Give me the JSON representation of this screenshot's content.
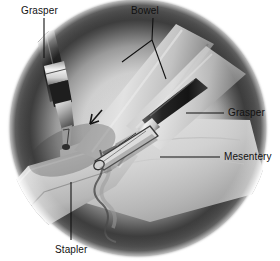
{
  "figure": {
    "type": "medical-illustration",
    "modality": "laparoscopic-view",
    "palette": {
      "background": "#ffffff",
      "vignette_dark": "#1b1b1b",
      "vignette_mid": "#6f6f6f",
      "tissue_light": "#dcdcdc",
      "tissue_mid": "#b4b4b4",
      "tissue_shadow": "#707070",
      "instrument_dark": "#2a2a2a",
      "instrument_metal": "#e8e8e8",
      "leader_line": "#111111",
      "label_text": "#111111"
    }
  },
  "labels": [
    {
      "id": "grasper-left",
      "text": "Grasper",
      "x": 21,
      "y": 5,
      "leader": {
        "type": "straight",
        "points": "44,18 44,58"
      }
    },
    {
      "id": "bowel",
      "text": "Bowel",
      "x": 131,
      "y": 5,
      "leader": {
        "type": "forked",
        "points": "153,18 152,40 122,62",
        "points2": "152,40 166,79"
      }
    },
    {
      "id": "grasper-right",
      "text": "Grasper",
      "x": 228,
      "y": 107,
      "leader": {
        "type": "straight",
        "points": "186,113 224,113"
      }
    },
    {
      "id": "mesentery",
      "text": "Mesentery",
      "x": 224,
      "y": 151,
      "leader": {
        "type": "straight",
        "points": "160,157 220,157"
      }
    },
    {
      "id": "stapler",
      "text": "Stapler",
      "x": 55,
      "y": 244,
      "leader": {
        "type": "straight",
        "points": "71,182 71,240"
      }
    }
  ],
  "anatomy": [
    {
      "id": "bowel-loop-upper",
      "name": "Bowel",
      "description": "Pale tubular bowel loop running from upper right to lower left"
    },
    {
      "id": "bowel-loop-lower",
      "name": "Bowel",
      "description": "Second bowel segment crossing beneath the first"
    },
    {
      "id": "mesentery",
      "name": "Mesentery",
      "description": "Fan-shaped light gray membrane filling the right side of the field"
    },
    {
      "id": "mesenteric-edge",
      "name": "Mesenteric edge",
      "description": "Scalloped vessel-bearing border below the stapler"
    }
  ],
  "instruments": [
    {
      "id": "grasper-left",
      "name": "Grasper",
      "description": "Laparoscopic grasper entering from upper left, jaws closed on bowel"
    },
    {
      "id": "grasper-right",
      "name": "Grasper",
      "description": "Laparoscopic grasper entering from right, jaws on mesentery"
    },
    {
      "id": "stapler",
      "name": "Stapler",
      "description": "Linear stapler jaw across the bowel at the center of the field"
    }
  ],
  "markers": [
    {
      "id": "arrow-marker",
      "name": "Arrow",
      "description": "Small dark arrow indicating the staple line",
      "x": 95,
      "y": 120
    }
  ]
}
